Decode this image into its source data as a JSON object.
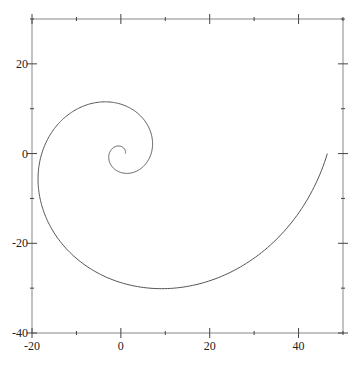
{
  "chart_data": {
    "type": "line",
    "title": "",
    "xlabel": "",
    "ylabel": "",
    "xlim": [
      -20,
      50
    ],
    "ylim": [
      -40,
      30
    ],
    "grid": false,
    "legend": null,
    "x_ticks": {
      "major": [
        -20,
        0,
        20,
        40
      ],
      "minor": [
        -10,
        10,
        30,
        50
      ],
      "labels": [
        "-20",
        "0",
        "20",
        "40"
      ]
    },
    "y_ticks": {
      "major": [
        -40,
        -20,
        0,
        20
      ],
      "minor": [
        -30,
        -10,
        10,
        30
      ],
      "labels": [
        "-40",
        "-20",
        "0",
        "20"
      ]
    },
    "mirror_ticks": true,
    "series": [
      {
        "name": "logarithmic spiral",
        "equation": "r = e^(b*theta), theta in [0, 4*pi]",
        "b": 0.3055,
        "theta_range": [
          0,
          12.566
        ],
        "color": "#555555",
        "points": [
          [
            1.0,
            0.0
          ],
          [
            1.04,
            0.43
          ],
          [
            0.9,
            0.9
          ],
          [
            0.55,
            1.32
          ],
          [
            0.0,
            1.62
          ],
          [
            -0.7,
            1.68
          ],
          [
            -1.45,
            1.45
          ],
          [
            -2.14,
            0.89
          ],
          [
            -2.61,
            0.0
          ],
          [
            -2.72,
            -1.13
          ],
          [
            -2.35,
            -2.35
          ],
          [
            -1.43,
            -3.46
          ],
          [
            0.0,
            -4.22
          ],
          [
            1.82,
            -4.4
          ],
          [
            3.79,
            -3.79
          ],
          [
            5.59,
            -2.32
          ],
          [
            6.82,
            0.0
          ],
          [
            7.11,
            2.94
          ],
          [
            6.13,
            6.13
          ],
          [
            3.74,
            9.03
          ],
          [
            0.0,
            11.03
          ],
          [
            -4.76,
            11.49
          ],
          [
            -9.91,
            9.91
          ],
          [
            -14.6,
            6.05
          ],
          [
            -17.82,
            0.0
          ],
          [
            -18.56,
            -7.69
          ],
          [
            -16.02,
            -16.02
          ],
          [
            -9.78,
            -23.6
          ],
          [
            0.0,
            -28.8
          ],
          [
            12.43,
            -30.0
          ],
          [
            25.89,
            -25.89
          ],
          [
            38.14,
            -15.8
          ],
          [
            46.55,
            0.0
          ]
        ]
      }
    ]
  },
  "style": {
    "axis_color": "#888888",
    "curve_color": "#555555",
    "background": "#ffffff"
  }
}
